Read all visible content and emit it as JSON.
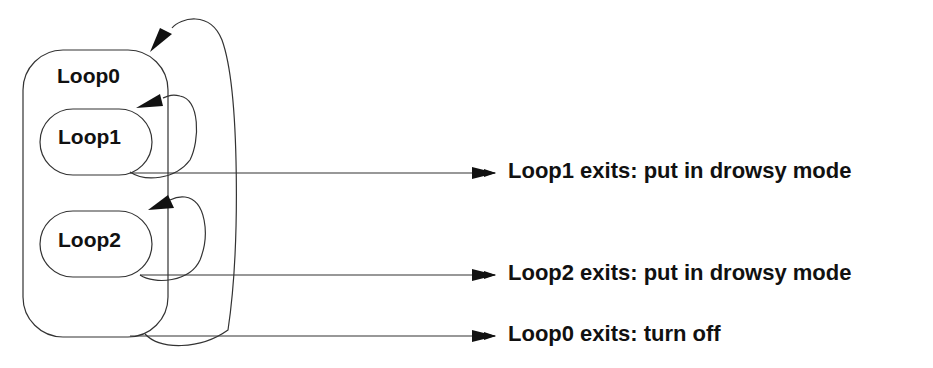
{
  "diagram": {
    "loops": [
      {
        "id": "loop0",
        "label": "Loop0"
      },
      {
        "id": "loop1",
        "label": "Loop1"
      },
      {
        "id": "loop2",
        "label": "Loop2"
      }
    ],
    "exits": [
      {
        "from": "Loop1",
        "label": "Loop1 exits: put in drowsy mode"
      },
      {
        "from": "Loop2",
        "label": "Loop2 exits: put in drowsy mode"
      },
      {
        "from": "Loop0",
        "label": "Loop0 exits: turn off"
      }
    ],
    "colors": {
      "stroke": "#222222",
      "text": "#111111",
      "background": "#ffffff"
    }
  }
}
